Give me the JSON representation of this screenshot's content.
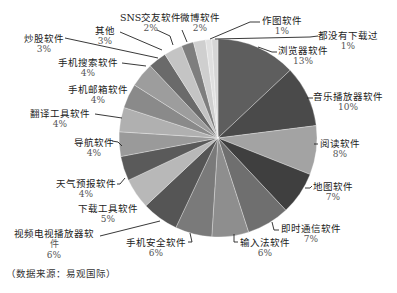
{
  "chart_data": {
    "type": "pie",
    "title": "",
    "start_angle": "12 o'clock",
    "direction": "clockwise",
    "unit": "%",
    "slices": [
      {
        "label": "浏览器软件",
        "value": 13,
        "color": "#5e5e5e"
      },
      {
        "label": "音乐播放器软件",
        "value": 10,
        "color": "#4a4a4a"
      },
      {
        "label": "阅读软件",
        "value": 8,
        "color": "#a3a3a3"
      },
      {
        "label": "地图软件",
        "value": 7,
        "color": "#3f3f3f"
      },
      {
        "label": "即时通信软件",
        "value": 7,
        "color": "#6f6f6f"
      },
      {
        "label": "输入法软件",
        "value": 6,
        "color": "#8e8e8e"
      },
      {
        "label": "手机安全软件",
        "value": 6,
        "color": "#7a7a7a"
      },
      {
        "label": "视频电视播放器软件",
        "value": 6,
        "color": "#555555"
      },
      {
        "label": "下载工具软件",
        "value": 5,
        "color": "#b8b8b8"
      },
      {
        "label": "天气预报软件",
        "value": 4,
        "color": "#5a5a5a"
      },
      {
        "label": "导航软件",
        "value": 4,
        "color": "#9a9a9a"
      },
      {
        "label": "翻译工具软件",
        "value": 4,
        "color": "#b0b0b0"
      },
      {
        "label": "手机邮箱软件",
        "value": 4,
        "color": "#8a8a8a"
      },
      {
        "label": "手机搜索软件",
        "value": 4,
        "color": "#9d9d9d"
      },
      {
        "label": "炒股软件",
        "value": 3,
        "color": "#6a6a6a"
      },
      {
        "label": "其他",
        "value": 3,
        "color": "#c4c4c4"
      },
      {
        "label": "SNS交友软件",
        "value": 2,
        "color": "#7e7e7e"
      },
      {
        "label": "微博软件",
        "value": 2,
        "color": "#cfcfcf"
      },
      {
        "label": "作图软件",
        "value": 1,
        "color": "#e0e0e0"
      },
      {
        "label": "都没有下载过",
        "value": 1,
        "color": "#d6d6d6"
      }
    ],
    "legend": "none (leader-line labels)",
    "source_note": "（数据来源：易观国际）"
  },
  "labels": [
    {
      "name": "浏览器软件",
      "pct": "13%"
    },
    {
      "name": "音乐播放器软件",
      "pct": "10%"
    },
    {
      "name": "阅读软件",
      "pct": "8%"
    },
    {
      "name": "地图软件",
      "pct": "7%"
    },
    {
      "name": "即时通信软件",
      "pct": "7%"
    },
    {
      "name": "输入法软件",
      "pct": "6%"
    },
    {
      "name": "手机安全软件",
      "pct": "6%"
    },
    {
      "name": "视频电视播放器软",
      "name2": "件",
      "pct": "6%"
    },
    {
      "name": "下载工具软件",
      "pct": "5%"
    },
    {
      "name": "天气预报软件",
      "pct": "4%"
    },
    {
      "name": "导航软件",
      "pct": "4%"
    },
    {
      "name": "翻译工具软件",
      "pct": "4%"
    },
    {
      "name": "手机邮箱软件",
      "pct": "4%"
    },
    {
      "name": "手机搜索软件",
      "pct": "4%"
    },
    {
      "name": "炒股软件",
      "pct": "3%"
    },
    {
      "name": "其他",
      "pct": "3%"
    },
    {
      "name": "SNS交友软件",
      "pct": "2%"
    },
    {
      "name": "微博软件",
      "pct": "2%"
    },
    {
      "name": "作图软件",
      "pct": "1%"
    },
    {
      "name": "都没有下载过",
      "pct": "1%"
    }
  ],
  "footer": {
    "source": "（数据来源：易观国际）"
  }
}
